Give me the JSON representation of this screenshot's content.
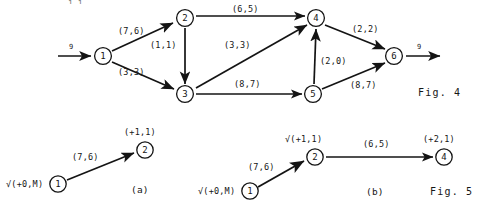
{
  "figure4": {
    "caption": "Fig. 4",
    "source_flow": "9",
    "sink_flow": "9",
    "nodes": [
      {
        "id": "1",
        "label": "1",
        "x": 103,
        "y": 56
      },
      {
        "id": "2",
        "label": "2",
        "x": 185,
        "y": 18
      },
      {
        "id": "3",
        "label": "3",
        "x": 185,
        "y": 94
      },
      {
        "id": "4",
        "label": "4",
        "x": 316,
        "y": 18
      },
      {
        "id": "5",
        "label": "5",
        "x": 313,
        "y": 94
      },
      {
        "id": "6",
        "label": "6",
        "x": 394,
        "y": 56
      }
    ],
    "edges": [
      {
        "from": "1",
        "to": "2",
        "label": "(7,6)",
        "lx": 118,
        "ly": 32
      },
      {
        "from": "1",
        "to": "3",
        "label": "(3,3)",
        "lx": 118,
        "ly": 73
      },
      {
        "from": "2",
        "to": "3",
        "label": "(1,1)",
        "lx": 152,
        "ly": 46
      },
      {
        "from": "2",
        "to": "4",
        "label": "(6,5)",
        "lx": 232,
        "ly": 10
      },
      {
        "from": "3",
        "to": "4",
        "label": "(3,3)",
        "lx": 224,
        "ly": 45
      },
      {
        "from": "3",
        "to": "5",
        "label": "(8,7)",
        "lx": 234,
        "ly": 84
      },
      {
        "from": "5",
        "to": "4",
        "label": "(2,0)",
        "lx": 320,
        "ly": 62
      },
      {
        "from": "4",
        "to": "6",
        "label": "(2,2)",
        "lx": 352,
        "ly": 30
      },
      {
        "from": "5",
        "to": "6",
        "label": "(8,7)",
        "lx": 350,
        "ly": 85
      }
    ]
  },
  "figure5": {
    "caption": "Fig. 5",
    "panels": [
      {
        "key": "a",
        "label": "(a)",
        "label_x": 131,
        "label_y": 188,
        "nodes": [
          {
            "id": "1",
            "label": "1",
            "x": 58,
            "y": 184,
            "tag": "√(+0,M)",
            "tag_x": 6,
            "tag_y": 180,
            "tag_align": "left"
          },
          {
            "id": "2",
            "label": "2",
            "x": 145,
            "y": 150,
            "tag": "(+1,1)",
            "tag_x": 124,
            "tag_y": 130,
            "tag_align": "left"
          }
        ],
        "edges": [
          {
            "from": "1",
            "to": "2",
            "label": "(7,6)",
            "lx": 72,
            "ly": 156
          }
        ]
      },
      {
        "key": "b",
        "label": "(b)",
        "label_x": 366,
        "label_y": 190,
        "nodes": [
          {
            "id": "1",
            "label": "1",
            "x": 250,
            "y": 191,
            "tag": "√(+0,M)",
            "tag_x": 198,
            "tag_y": 187,
            "tag_align": "left"
          },
          {
            "id": "2",
            "label": "2",
            "x": 315,
            "y": 157,
            "tag": "√(+1,1)",
            "tag_x": 285,
            "tag_y": 137,
            "tag_align": "left"
          },
          {
            "id": "4",
            "label": "4",
            "x": 444,
            "y": 157,
            "tag": "(+2,1)",
            "tag_x": 423,
            "tag_y": 137,
            "tag_align": "left"
          }
        ],
        "edges": [
          {
            "from": "1",
            "to": "2",
            "label": "(7,6)",
            "lx": 248,
            "ly": 165
          },
          {
            "from": "2",
            "to": "4",
            "label": "(6,5)",
            "lx": 363,
            "ly": 144
          }
        ]
      }
    ],
    "caption_x": 430,
    "caption_y": 190
  },
  "fig4_caption_x": 418,
  "fig4_caption_y": 92,
  "top_cut_text": "1,1",
  "colors": {
    "ink": "#141414",
    "paper": "#ffffff"
  }
}
